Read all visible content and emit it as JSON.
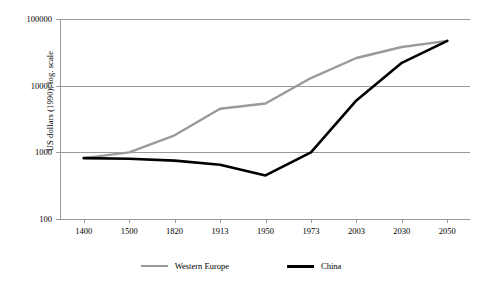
{
  "chart_data": {
    "type": "line",
    "title": "",
    "xlabel": "",
    "ylabel": "US dollars (1990); log. scale",
    "yscale": "log",
    "ylim": [
      100,
      100000
    ],
    "yticks": [
      100,
      1000,
      10000,
      100000
    ],
    "ytick_labels": [
      "100",
      "1000",
      "10000",
      "100000"
    ],
    "grid": true,
    "legend_position": "bottom",
    "categories": [
      "1400",
      "1500",
      "1820",
      "1913",
      "1950",
      "1973",
      "2003",
      "2030",
      "2050"
    ],
    "series": [
      {
        "name": "Western Europe",
        "color": "#9a9a9a",
        "values": [
          820,
          1000,
          1800,
          4500,
          5400,
          13000,
          26000,
          38000,
          47000
        ]
      },
      {
        "name": "China",
        "color": "#000000",
        "values": [
          820,
          800,
          750,
          650,
          450,
          1000,
          6000,
          22000,
          47000
        ]
      }
    ]
  },
  "legend": {
    "items": [
      {
        "label": "Western Europe",
        "color": "#9a9a9a"
      },
      {
        "label": "China",
        "color": "#000000"
      }
    ]
  },
  "axes": {
    "y_title": "US dollars (1990); log. scale"
  }
}
